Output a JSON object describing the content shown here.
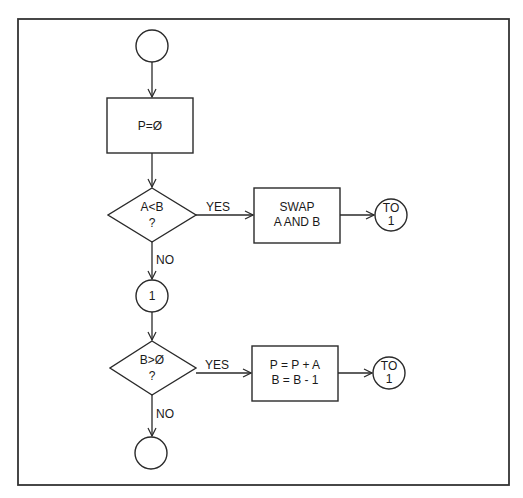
{
  "diagram": {
    "type": "flowchart",
    "nodes": {
      "start": {
        "kind": "terminal",
        "label": ""
      },
      "init": {
        "kind": "process",
        "label": "P=Ø"
      },
      "decision1": {
        "kind": "decision",
        "line1": "A<B",
        "line2": "?"
      },
      "swap": {
        "kind": "process",
        "line1": "SWAP",
        "line2": "A AND B"
      },
      "goto1_a": {
        "kind": "connector",
        "line1": "TO",
        "line2": "1"
      },
      "connector1": {
        "kind": "connector",
        "label": "1"
      },
      "decision2": {
        "kind": "decision",
        "line1": "B>Ø",
        "line2": "?"
      },
      "update": {
        "kind": "process",
        "line1": "P = P + A",
        "line2": "B = B - 1"
      },
      "goto1_b": {
        "kind": "connector",
        "line1": "TO",
        "line2": "1"
      },
      "end": {
        "kind": "terminal",
        "label": ""
      }
    },
    "edges": {
      "d1_yes": "YES",
      "d1_no": "NO",
      "d2_yes": "YES",
      "d2_no": "NO"
    }
  }
}
